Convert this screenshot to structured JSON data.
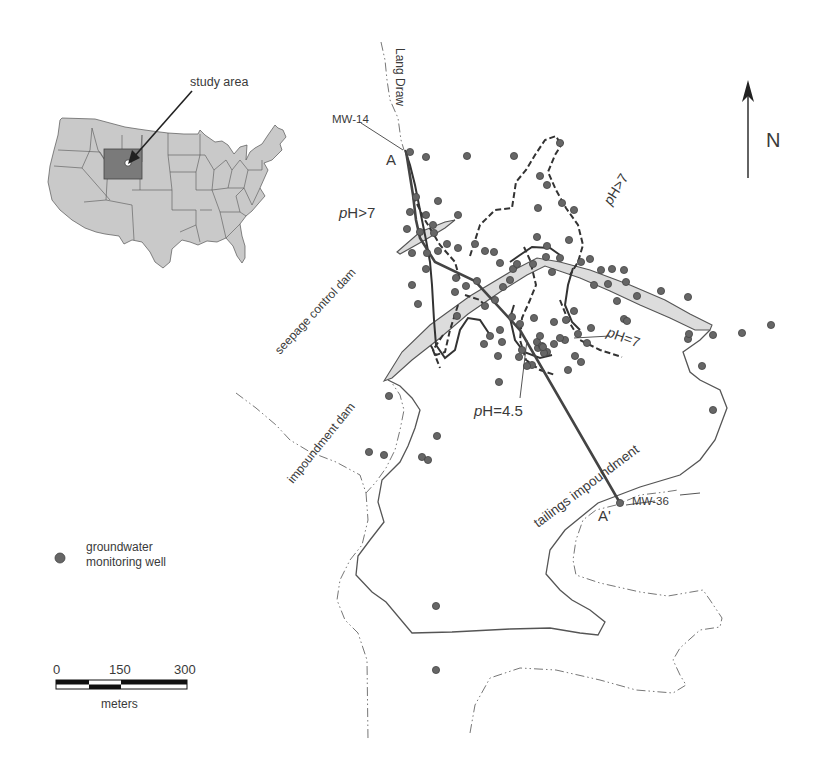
{
  "inset_map": {
    "label": "study area",
    "highlight_state": "Wyoming",
    "colors": {
      "states": "#c9c9c9",
      "highlight": "#7a7a7a"
    }
  },
  "north_arrow": {
    "label": "N"
  },
  "labels": {
    "lang_draw": "Lang Draw",
    "mw14": "MW-14",
    "mw36": "MW-36",
    "section_start": "A",
    "section_end": "A'",
    "ph_gt7_left_prefix": "p",
    "ph_gt7_left": "H>7",
    "ph_gt7_right_prefix": "p",
    "ph_gt7_right": "H>7",
    "ph7_prefix": "p",
    "ph7": "H=7",
    "ph45_prefix": "p",
    "ph45": "H=4.5",
    "seepage_dam": "seepage control dam",
    "impoundment_dam": "impoundment dam",
    "tailings": "tailings impoundment"
  },
  "legend": {
    "well_label_line1": "groundwater",
    "well_label_line2": "monitoring well",
    "well_color": "#666666"
  },
  "scale_bar": {
    "ticks": [
      "0",
      "150",
      "300"
    ],
    "unit": "meters"
  },
  "wells": [
    [
      410,
      152
    ],
    [
      426,
      157
    ],
    [
      467,
      156
    ],
    [
      514,
      156
    ],
    [
      560,
      143
    ],
    [
      540,
      176
    ],
    [
      547,
      185
    ],
    [
      562,
      203
    ],
    [
      538,
      208
    ],
    [
      574,
      210
    ],
    [
      537,
      237
    ],
    [
      416,
      197
    ],
    [
      438,
      201
    ],
    [
      410,
      212
    ],
    [
      426,
      215
    ],
    [
      433,
      225
    ],
    [
      407,
      229
    ],
    [
      420,
      232
    ],
    [
      434,
      233
    ],
    [
      458,
      215
    ],
    [
      412,
      253
    ],
    [
      427,
      253
    ],
    [
      438,
      251
    ],
    [
      447,
      244
    ],
    [
      458,
      248
    ],
    [
      475,
      244
    ],
    [
      426,
      269
    ],
    [
      456,
      278
    ],
    [
      412,
      285
    ],
    [
      418,
      304
    ],
    [
      455,
      292
    ],
    [
      466,
      286
    ],
    [
      477,
      281
    ],
    [
      503,
      287
    ],
    [
      510,
      280
    ],
    [
      513,
      269
    ],
    [
      533,
      264
    ],
    [
      546,
      257
    ],
    [
      552,
      272
    ],
    [
      560,
      258
    ],
    [
      569,
      240
    ],
    [
      581,
      262
    ],
    [
      590,
      259
    ],
    [
      612,
      269
    ],
    [
      624,
      270
    ],
    [
      626,
      282
    ],
    [
      594,
      285
    ],
    [
      457,
      316
    ],
    [
      485,
      306
    ],
    [
      495,
      300
    ],
    [
      500,
      330
    ],
    [
      520,
      324
    ],
    [
      534,
      318
    ],
    [
      554,
      322
    ],
    [
      566,
      320
    ],
    [
      574,
      311
    ],
    [
      578,
      334
    ],
    [
      591,
      328
    ],
    [
      587,
      343
    ],
    [
      490,
      336
    ],
    [
      512,
      317
    ],
    [
      522,
      350
    ],
    [
      532,
      365
    ],
    [
      538,
      348
    ],
    [
      554,
      344
    ],
    [
      565,
      340
    ],
    [
      575,
      356
    ],
    [
      581,
      362
    ],
    [
      560,
      338
    ],
    [
      547,
      352
    ],
    [
      568,
      370
    ],
    [
      484,
      344
    ],
    [
      498,
      356
    ],
    [
      519,
      357
    ],
    [
      537,
      342
    ],
    [
      542,
      346
    ],
    [
      527,
      366
    ],
    [
      502,
      342
    ],
    [
      540,
      336
    ],
    [
      547,
      246
    ],
    [
      517,
      264
    ],
    [
      500,
      263
    ],
    [
      485,
      251
    ],
    [
      494,
      252
    ],
    [
      601,
      270
    ],
    [
      608,
      284
    ],
    [
      617,
      301
    ],
    [
      637,
      296
    ],
    [
      661,
      291
    ],
    [
      624,
      319
    ],
    [
      627,
      321
    ],
    [
      688,
      297
    ],
    [
      688,
      339
    ],
    [
      689,
      334
    ],
    [
      713,
      335
    ],
    [
      742,
      333
    ],
    [
      771,
      325
    ],
    [
      702,
      366
    ],
    [
      713,
      410
    ],
    [
      499,
      382
    ],
    [
      437,
      436
    ],
    [
      544,
      353
    ],
    [
      543,
      347
    ],
    [
      389,
      396
    ],
    [
      369,
      452
    ],
    [
      384,
      455
    ],
    [
      422,
      457
    ],
    [
      428,
      460
    ],
    [
      436,
      606
    ],
    [
      436,
      670
    ],
    [
      620,
      503
    ]
  ]
}
